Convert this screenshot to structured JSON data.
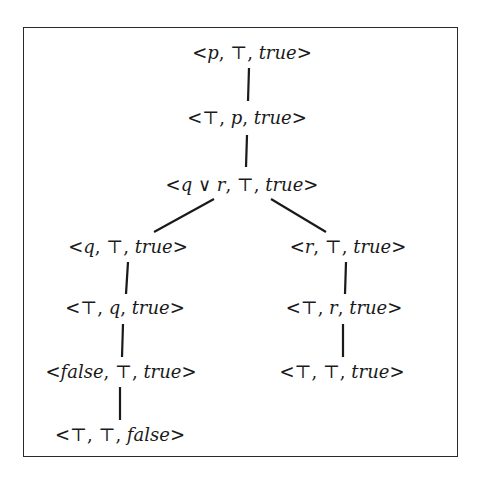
{
  "diagram": {
    "type": "derivation-tree",
    "nodes": [
      {
        "id": "n1",
        "label": "<p, ⊤, true>",
        "x": 252,
        "y": 52
      },
      {
        "id": "n2",
        "label": "<⊤, p, true>",
        "x": 247,
        "y": 117
      },
      {
        "id": "n3",
        "label": "<q ∨ r, ⊤, true>",
        "x": 242,
        "y": 184
      },
      {
        "id": "n4",
        "label": "<q, ⊤, true>",
        "x": 128,
        "y": 246
      },
      {
        "id": "n5",
        "label": "<r, ⊤, true>",
        "x": 348,
        "y": 246
      },
      {
        "id": "n6",
        "label": "<⊤, q, true>",
        "x": 125,
        "y": 307
      },
      {
        "id": "n7",
        "label": "<⊤, r, true>",
        "x": 344,
        "y": 307
      },
      {
        "id": "n8",
        "label": "<false, ⊤, true>",
        "x": 121,
        "y": 371
      },
      {
        "id": "n9",
        "label": "<⊤, ⊤, true>",
        "x": 342,
        "y": 371
      },
      {
        "id": "n10",
        "label": "<⊤, ⊤, false>",
        "x": 120,
        "y": 434
      }
    ],
    "edges": [
      {
        "from": "n1",
        "to": "n2",
        "x1": 249,
        "y1": 68,
        "x2": 248,
        "y2": 101
      },
      {
        "from": "n2",
        "to": "n3",
        "x1": 247,
        "y1": 135,
        "x2": 246,
        "y2": 167
      },
      {
        "from": "n3",
        "to": "n4",
        "x1": 214,
        "y1": 199,
        "x2": 154,
        "y2": 232
      },
      {
        "from": "n3",
        "to": "n5",
        "x1": 271,
        "y1": 199,
        "x2": 326,
        "y2": 232
      },
      {
        "from": "n4",
        "to": "n6",
        "x1": 128,
        "y1": 262,
        "x2": 126,
        "y2": 294
      },
      {
        "from": "n5",
        "to": "n7",
        "x1": 346,
        "y1": 262,
        "x2": 345,
        "y2": 294
      },
      {
        "from": "n6",
        "to": "n8",
        "x1": 123,
        "y1": 324,
        "x2": 122,
        "y2": 357
      },
      {
        "from": "n7",
        "to": "n9",
        "x1": 343,
        "y1": 324,
        "x2": 343,
        "y2": 357
      },
      {
        "from": "n8",
        "to": "n10",
        "x1": 120,
        "y1": 387,
        "x2": 120,
        "y2": 420
      }
    ],
    "labels": {
      "n1": [
        {
          "t": "<"
        },
        {
          "t": "p",
          "i": true
        },
        {
          "t": ", ⊤, "
        },
        {
          "t": "true",
          "i": true
        },
        {
          "t": ">"
        }
      ],
      "n2": [
        {
          "t": "<⊤, "
        },
        {
          "t": "p",
          "i": true
        },
        {
          "t": ", "
        },
        {
          "t": "true",
          "i": true
        },
        {
          "t": ">"
        }
      ],
      "n3": [
        {
          "t": "<"
        },
        {
          "t": "q",
          "i": true
        },
        {
          "t": " ∨ "
        },
        {
          "t": "r",
          "i": true
        },
        {
          "t": ", ⊤, "
        },
        {
          "t": "true",
          "i": true
        },
        {
          "t": ">"
        }
      ],
      "n4": [
        {
          "t": "<"
        },
        {
          "t": "q",
          "i": true
        },
        {
          "t": ", ⊤, "
        },
        {
          "t": "true",
          "i": true
        },
        {
          "t": ">"
        }
      ],
      "n5": [
        {
          "t": "<"
        },
        {
          "t": "r",
          "i": true
        },
        {
          "t": ", ⊤, "
        },
        {
          "t": "true",
          "i": true
        },
        {
          "t": ">"
        }
      ],
      "n6": [
        {
          "t": "<⊤, "
        },
        {
          "t": "q",
          "i": true
        },
        {
          "t": ", "
        },
        {
          "t": "true",
          "i": true
        },
        {
          "t": ">"
        }
      ],
      "n7": [
        {
          "t": "<⊤, "
        },
        {
          "t": "r",
          "i": true
        },
        {
          "t": ", "
        },
        {
          "t": "true",
          "i": true
        },
        {
          "t": ">"
        }
      ],
      "n8": [
        {
          "t": "<"
        },
        {
          "t": "false",
          "i": true
        },
        {
          "t": ", ⊤, "
        },
        {
          "t": "true",
          "i": true
        },
        {
          "t": ">"
        }
      ],
      "n9": [
        {
          "t": "<⊤, ⊤, "
        },
        {
          "t": "true",
          "i": true
        },
        {
          "t": ">"
        }
      ],
      "n10": [
        {
          "t": "<⊤, ⊤, "
        },
        {
          "t": "false",
          "i": true
        },
        {
          "t": ">"
        }
      ]
    }
  }
}
